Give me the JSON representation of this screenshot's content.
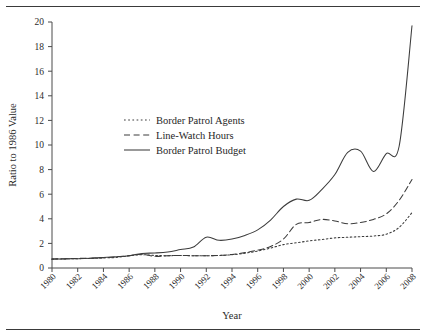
{
  "figure": {
    "rule_top": "horizontal-rule",
    "rule_bottom": "horizontal-rule"
  },
  "chart_data": {
    "type": "line",
    "title": "",
    "subtitle": "",
    "xlabel": "Year",
    "ylabel": "Ratio to 1986 Value",
    "xlim": [
      1980,
      2008
    ],
    "ylim": [
      0,
      20
    ],
    "grid": false,
    "legend_position": "center-left",
    "x_tick_labels": [
      "1980",
      "1982",
      "1984",
      "1986",
      "1988",
      "1990",
      "1992",
      "1994",
      "1996",
      "1998",
      "2000",
      "2002",
      "2004",
      "2006",
      "2008"
    ],
    "y_tick_labels": [
      "0",
      "2",
      "4",
      "6",
      "8",
      "10",
      "12",
      "14",
      "16",
      "18",
      "20"
    ],
    "x": [
      1980,
      1981,
      1982,
      1983,
      1984,
      1985,
      1986,
      1987,
      1988,
      1989,
      1990,
      1991,
      1992,
      1993,
      1994,
      1995,
      1996,
      1997,
      1998,
      1999,
      2000,
      2001,
      2002,
      2003,
      2004,
      2005,
      2006,
      2007,
      2008
    ],
    "series": [
      {
        "name": "Border Patrol Agents",
        "style": "dotted",
        "color": "#3c3c3c",
        "values": [
          0.72,
          0.74,
          0.76,
          0.78,
          0.82,
          0.86,
          1.0,
          1.08,
          1.02,
          1.0,
          1.02,
          1.0,
          1.0,
          1.02,
          1.08,
          1.2,
          1.38,
          1.62,
          1.9,
          2.05,
          2.2,
          2.32,
          2.45,
          2.5,
          2.55,
          2.6,
          2.75,
          3.3,
          4.5
        ]
      },
      {
        "name": "Line-Watch Hours",
        "style": "dashed",
        "color": "#3c3c3c",
        "values": [
          0.74,
          0.76,
          0.78,
          0.8,
          0.84,
          0.9,
          1.0,
          1.12,
          0.95,
          1.0,
          1.02,
          1.0,
          1.0,
          1.03,
          1.1,
          1.25,
          1.45,
          1.75,
          2.35,
          3.55,
          3.7,
          3.95,
          3.82,
          3.6,
          3.7,
          3.95,
          4.4,
          5.5,
          7.2
        ]
      },
      {
        "name": "Border Patrol Budget",
        "style": "solid",
        "color": "#3c3c3c",
        "values": [
          0.72,
          0.74,
          0.76,
          0.8,
          0.86,
          0.92,
          1.0,
          1.18,
          1.22,
          1.3,
          1.5,
          1.7,
          2.5,
          2.25,
          2.35,
          2.65,
          3.1,
          3.9,
          5.0,
          5.6,
          5.5,
          6.4,
          7.6,
          9.4,
          9.5,
          7.85,
          9.3,
          9.9,
          19.7
        ]
      }
    ]
  }
}
